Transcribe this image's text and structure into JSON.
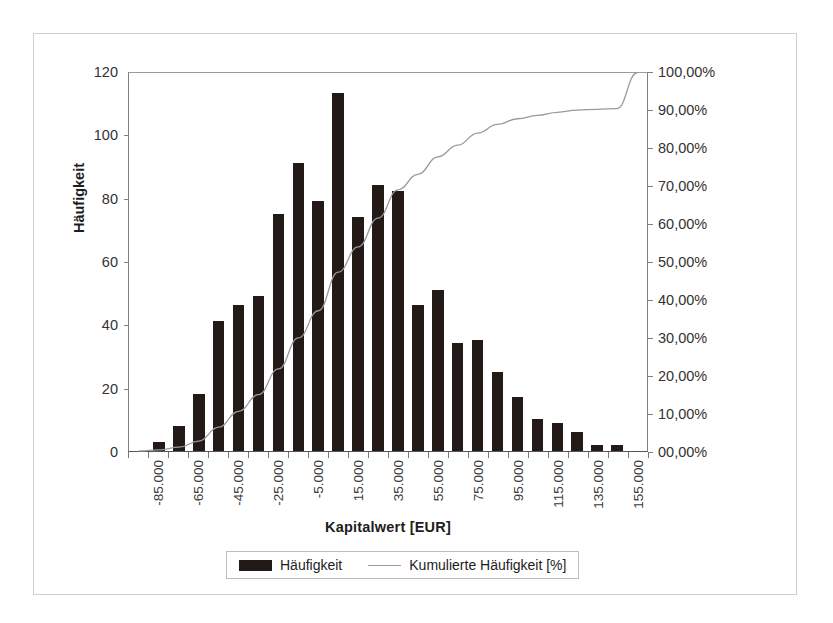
{
  "chart_data": {
    "type": "bar",
    "title": "",
    "xlabel": "Kapitalwert [EUR]",
    "ylabel": "Häufigkeit",
    "y2label": "",
    "grid": false,
    "legend_position": "bottom",
    "ylim": [
      0,
      120
    ],
    "y2lim": [
      0,
      100
    ],
    "yticks": [
      "0",
      "20",
      "40",
      "60",
      "80",
      "100",
      "120"
    ],
    "ytick_values": [
      0,
      20,
      40,
      60,
      80,
      100,
      120
    ],
    "y2ticks": [
      "00,00%",
      "10,00%",
      "20,00%",
      "30,00%",
      "40,00%",
      "50,00%",
      "60,00%",
      "70,00%",
      "80,00%",
      "90,00%",
      "100,00%"
    ],
    "y2tick_values": [
      0,
      10,
      20,
      30,
      40,
      50,
      60,
      70,
      80,
      90,
      100
    ],
    "xtick_labels": [
      "-85.000",
      "-65.000",
      "-45.000",
      "-25.000",
      "-5.000",
      "15.000",
      "35.000",
      "55.000",
      "75.000",
      "95.000",
      "115.000",
      "135.000",
      "155.000"
    ],
    "xtick_label_step": 2,
    "categories": [
      "-95.000",
      "-85.000",
      "-75.000",
      "-65.000",
      "-55.000",
      "-45.000",
      "-35.000",
      "-25.000",
      "-15.000",
      "-5.000",
      "5.000",
      "15.000",
      "25.000",
      "35.000",
      "45.000",
      "55.000",
      "65.000",
      "75.000",
      "85.000",
      "95.000",
      "105.000",
      "115.000",
      "125.000",
      "135.000",
      "145.000",
      "155.000"
    ],
    "series": [
      {
        "name": "Häufigkeit",
        "kind": "bar",
        "color": "#231a17",
        "axis": "left",
        "values": [
          0,
          3,
          8,
          18,
          41,
          46,
          49,
          75,
          91,
          79,
          113,
          74,
          84,
          82,
          46,
          51,
          34,
          35,
          25,
          17,
          10,
          9,
          6,
          2,
          2,
          0
        ]
      },
      {
        "name": "Kumulierte Häufigkeit [%]",
        "kind": "line",
        "color": "#9a9a9a",
        "axis": "right",
        "values": [
          0.0,
          0.3,
          1.0,
          2.6,
          6.3,
          10.5,
          14.9,
          21.7,
          29.9,
          37.1,
          47.3,
          54.0,
          61.6,
          69.1,
          73.2,
          77.8,
          80.9,
          84.1,
          86.4,
          87.9,
          88.8,
          89.6,
          90.2,
          90.4,
          90.6,
          100.0
        ]
      }
    ]
  },
  "legend": {
    "items": [
      {
        "label": "Häufigkeit",
        "marker": "bar-swatch"
      },
      {
        "label": "Kumulierte Häufigkeit [%]",
        "marker": "line-swatch"
      }
    ]
  }
}
